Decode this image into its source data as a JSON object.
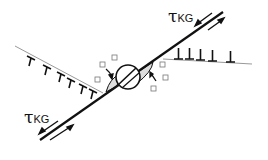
{
  "labels": {
    "top": {
      "symbol": "τ",
      "subscript": "KG"
    },
    "bottom": {
      "symbol": "τ",
      "subscript": "KG"
    }
  },
  "colors": {
    "line": "#111111",
    "boundary": "#999999",
    "fill": "#dddddd"
  }
}
